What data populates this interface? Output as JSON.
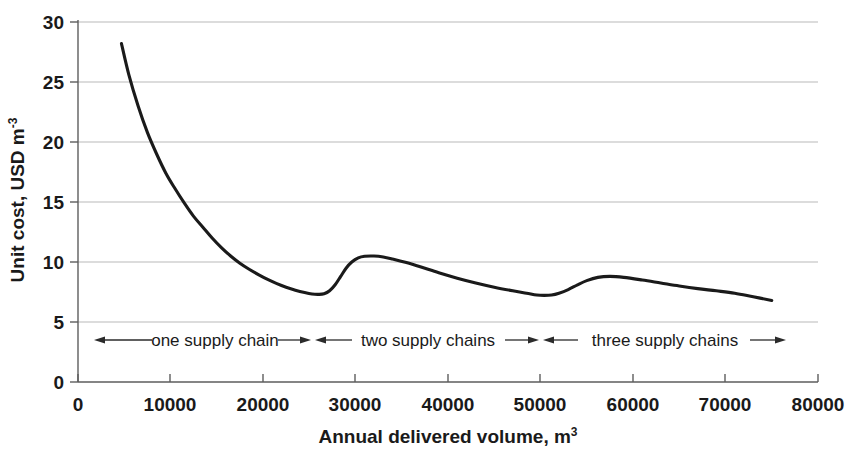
{
  "chart_data": {
    "type": "line",
    "title": "",
    "xlabel": "Annual delivered volume, m³",
    "ylabel": "Unit cost, USD m⁻³",
    "xlabel_base": "Annual delivered volume, m",
    "xlabel_sup": "3",
    "ylabel_base": "Unit cost, USD m",
    "ylabel_sup": "-3",
    "xlim": [
      0,
      80000
    ],
    "ylim": [
      0,
      30
    ],
    "xticks": [
      0,
      10000,
      20000,
      30000,
      40000,
      50000,
      60000,
      70000,
      80000
    ],
    "xtick_labels": [
      "0",
      "10000",
      "20000",
      "30000",
      "40000",
      "50000",
      "60000",
      "70000",
      "80000"
    ],
    "yticks": [
      0,
      5,
      10,
      15,
      20,
      25,
      30
    ],
    "ytick_labels": [
      "0",
      "5",
      "10",
      "15",
      "20",
      "25",
      "30"
    ],
    "grid": "horizontal",
    "legend": "none",
    "series": [
      {
        "name": "unit cost",
        "color": "#1a1a1a",
        "x": [
          4700,
          5500,
          6500,
          7500,
          8500,
          9500,
          10500,
          11500,
          12500,
          13500,
          14500,
          15500,
          16500,
          17500,
          18500,
          19500,
          20500,
          21500,
          22500,
          23500,
          24500,
          25300,
          26000,
          26600,
          27200,
          27800,
          28400,
          29000,
          29600,
          30300,
          31000,
          32000,
          33000,
          34000,
          35500,
          37000,
          39000,
          41000,
          43000,
          45000,
          47000,
          48500,
          49600,
          50400,
          51200,
          52000,
          53000,
          54000,
          55000,
          56200,
          57500,
          59000,
          61000,
          63000,
          65000,
          67000,
          69000,
          71000,
          73000,
          75000
        ],
        "y": [
          28.2,
          25.6,
          23.0,
          20.8,
          19.0,
          17.4,
          16.1,
          14.9,
          13.8,
          12.9,
          12.0,
          11.2,
          10.5,
          9.9,
          9.4,
          8.95,
          8.55,
          8.2,
          7.9,
          7.65,
          7.45,
          7.33,
          7.3,
          7.35,
          7.6,
          8.1,
          8.8,
          9.5,
          10.0,
          10.35,
          10.48,
          10.5,
          10.42,
          10.25,
          9.95,
          9.6,
          9.1,
          8.65,
          8.25,
          7.9,
          7.6,
          7.4,
          7.25,
          7.22,
          7.25,
          7.4,
          7.7,
          8.1,
          8.45,
          8.72,
          8.8,
          8.72,
          8.5,
          8.25,
          8.0,
          7.78,
          7.6,
          7.4,
          7.1,
          6.8
        ]
      }
    ],
    "annotations": [
      {
        "label": "one supply chain",
        "x_start": 2400,
        "x_end": 25200,
        "y": 4.05,
        "arrow": "both-outward"
      },
      {
        "label": "two supply chains",
        "x_start": 25500,
        "x_end": 49700,
        "y": 4.05,
        "arrow": "both-outward"
      },
      {
        "label": "three supply chains",
        "x_start": 50100,
        "x_end": 78500,
        "y": 4.05,
        "arrow": "both-outward"
      }
    ]
  }
}
